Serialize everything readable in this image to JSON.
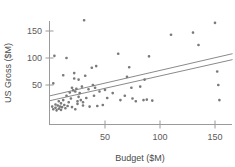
{
  "chart_data": {
    "type": "scatter",
    "title": "",
    "xlabel": "Budget ($M)",
    "ylabel": "US Gross ($M)",
    "xlim": [
      -4,
      166
    ],
    "ylim": [
      -8,
      182
    ],
    "xticks": [
      50,
      100,
      150
    ],
    "xtick_labels": [
      "50",
      "100",
      "150"
    ],
    "yticks": [
      50,
      100,
      150
    ],
    "ytick_labels": [
      "50",
      "100",
      "150"
    ],
    "grid": false,
    "legend": null,
    "marker_color": "#7a7a7a",
    "line_color": "#8a8a8a",
    "axis_color": "#9a9a9a",
    "points": [
      [
        2,
        10
      ],
      [
        3,
        5
      ],
      [
        3,
        53
      ],
      [
        4,
        104
      ],
      [
        5,
        8
      ],
      [
        5,
        14
      ],
      [
        6,
        3
      ],
      [
        7,
        12
      ],
      [
        8,
        6
      ],
      [
        8,
        20
      ],
      [
        9,
        10
      ],
      [
        10,
        4
      ],
      [
        10,
        16
      ],
      [
        11,
        9
      ],
      [
        12,
        22
      ],
      [
        12,
        68
      ],
      [
        13,
        13
      ],
      [
        14,
        7
      ],
      [
        15,
        30
      ],
      [
        15,
        100
      ],
      [
        16,
        11
      ],
      [
        17,
        18
      ],
      [
        18,
        36
      ],
      [
        19,
        25
      ],
      [
        20,
        9
      ],
      [
        20,
        45
      ],
      [
        21,
        40
      ],
      [
        22,
        62
      ],
      [
        22,
        72
      ],
      [
        23,
        38
      ],
      [
        23,
        5
      ],
      [
        24,
        43
      ],
      [
        25,
        20
      ],
      [
        25,
        15
      ],
      [
        26,
        28
      ],
      [
        26,
        60
      ],
      [
        27,
        35
      ],
      [
        28,
        22
      ],
      [
        29,
        47
      ],
      [
        30,
        12
      ],
      [
        30,
        18
      ],
      [
        31,
        170
      ],
      [
        32,
        67
      ],
      [
        33,
        26
      ],
      [
        35,
        42
      ],
      [
        36,
        10
      ],
      [
        38,
        82
      ],
      [
        39,
        50
      ],
      [
        40,
        30
      ],
      [
        41,
        45
      ],
      [
        42,
        85
      ],
      [
        43,
        11
      ],
      [
        45,
        38
      ],
      [
        48,
        13
      ],
      [
        50,
        41
      ],
      [
        52,
        26
      ],
      [
        57,
        35
      ],
      [
        62,
        108
      ],
      [
        64,
        22
      ],
      [
        68,
        30
      ],
      [
        70,
        65
      ],
      [
        72,
        83
      ],
      [
        74,
        45
      ],
      [
        75,
        25
      ],
      [
        78,
        20
      ],
      [
        82,
        47
      ],
      [
        85,
        22
      ],
      [
        86,
        60
      ],
      [
        88,
        23
      ],
      [
        90,
        103
      ],
      [
        93,
        21
      ],
      [
        110,
        143
      ],
      [
        130,
        147
      ],
      [
        135,
        124
      ],
      [
        150,
        165
      ],
      [
        152,
        75
      ],
      [
        153,
        50
      ],
      [
        154,
        22
      ]
    ],
    "fit_lines": [
      {
        "name": "upper-fit-line",
        "x0": 0,
        "y0": 30,
        "x1": 166,
        "y1": 108
      },
      {
        "name": "lower-fit-line",
        "x0": 0,
        "y0": 21,
        "x1": 166,
        "y1": 97
      }
    ]
  }
}
